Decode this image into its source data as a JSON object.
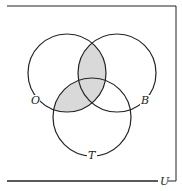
{
  "diagram": {
    "type": "venn",
    "universe_label": "U",
    "sets": [
      {
        "label": "O",
        "cx": 67,
        "cy": 73,
        "r": 39
      },
      {
        "label": "B",
        "cx": 117,
        "cy": 73,
        "r": 39
      },
      {
        "label": "T",
        "cx": 92,
        "cy": 117,
        "r": 39
      }
    ],
    "shaded_regions": [
      "O∩B",
      "O∩T"
    ],
    "colors": {
      "stroke": "#222222",
      "shade": "#d9d9d9",
      "background": "#ffffff"
    }
  }
}
